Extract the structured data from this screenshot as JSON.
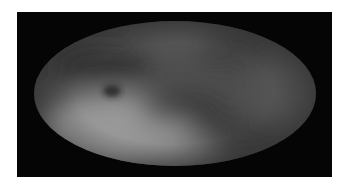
{
  "image": {
    "description": "All-sky map in elliptical (Mollweide) projection, grayscale",
    "colors": {
      "page_background": "#ffffff",
      "frame_background": "#050505",
      "base_gray": "#4e4e4e",
      "bright_region": "#a0a0a0",
      "dark_band": "#2e2e2e"
    },
    "features": [
      {
        "name": "bright-lower-left-lobe",
        "cx": 80,
        "cy": 110,
        "rx": 75,
        "ry": 38,
        "color": "#a4a4a4",
        "opacity": 0.85
      },
      {
        "name": "bright-lower-center",
        "cx": 140,
        "cy": 128,
        "rx": 40,
        "ry": 22,
        "color": "#8a8a8a",
        "opacity": 0.6
      },
      {
        "name": "dark-band-upper-left",
        "cx": 70,
        "cy": 45,
        "rx": 50,
        "ry": 16,
        "color": "#2a2a2a",
        "opacity": 0.75
      },
      {
        "name": "dark-spot",
        "cx": 78,
        "cy": 70,
        "rx": 9,
        "ry": 6,
        "color": "#222222",
        "opacity": 0.9
      },
      {
        "name": "dark-band-center",
        "cx": 150,
        "cy": 88,
        "rx": 45,
        "ry": 14,
        "color": "#2c2c2c",
        "opacity": 0.7
      },
      {
        "name": "dark-band-lower-right",
        "cx": 205,
        "cy": 112,
        "rx": 40,
        "ry": 15,
        "color": "#303030",
        "opacity": 0.6
      },
      {
        "name": "dark-upper-right",
        "cx": 195,
        "cy": 30,
        "rx": 40,
        "ry": 18,
        "color": "#353535",
        "opacity": 0.6
      },
      {
        "name": "light-top-center",
        "cx": 145,
        "cy": 22,
        "rx": 35,
        "ry": 14,
        "color": "#5c5c5c",
        "opacity": 0.6
      },
      {
        "name": "light-right",
        "cx": 245,
        "cy": 72,
        "rx": 30,
        "ry": 30,
        "color": "#5a5a5a",
        "opacity": 0.5
      }
    ]
  }
}
